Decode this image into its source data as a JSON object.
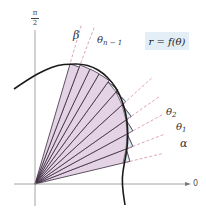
{
  "figure": {
    "equation_label": "r = f(θ)",
    "axis_labels": {
      "vertical": "π/2",
      "vertical_num": "π",
      "vertical_den": "2",
      "horizontal": "0"
    },
    "ray_labels": {
      "beta": "β",
      "theta_n_minus_1_base": "θ",
      "theta_n_minus_1_sub": "n − 1",
      "theta_2_base": "θ",
      "theta_2_sub": "2",
      "theta_1_base": "θ",
      "theta_1_sub": "1",
      "alpha": "α"
    },
    "colors": {
      "sector_fill": "#e3d3e5",
      "sector_edge": "#3a2a3e",
      "excess_fill": "#dff0f2",
      "dashed_ray": "#d99ab4",
      "curve": "#1a1a1a",
      "axis": "#9a9a9a",
      "equation_box": "#e3eef6"
    },
    "origin": [
      35,
      184
    ],
    "curve_points": [
      [
        14,
        89
      ],
      [
        30,
        78
      ],
      [
        45,
        70
      ],
      [
        58,
        65
      ],
      [
        70,
        64
      ],
      [
        82,
        64
      ],
      [
        93,
        67
      ],
      [
        103,
        73
      ],
      [
        112,
        82
      ],
      [
        119,
        93
      ],
      [
        124,
        106
      ],
      [
        127,
        120
      ],
      [
        128,
        135
      ],
      [
        127,
        150
      ],
      [
        124,
        165
      ],
      [
        122,
        178
      ],
      [
        123,
        192
      ],
      [
        125,
        205
      ]
    ],
    "sector_endpoints": [
      [
        123,
        163
      ],
      [
        126,
        149
      ],
      [
        127,
        134
      ],
      [
        126,
        120
      ],
      [
        122,
        105
      ],
      [
        116,
        92
      ],
      [
        108,
        82
      ],
      [
        99,
        74
      ],
      [
        90,
        69
      ],
      [
        80,
        65
      ],
      [
        70,
        64
      ]
    ]
  }
}
